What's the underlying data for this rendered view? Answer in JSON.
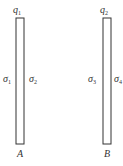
{
  "diagram": {
    "type": "parallel-plates",
    "plates": [
      {
        "name": "A",
        "charge_label": "q",
        "charge_sub": "1",
        "left_density": "σ",
        "left_density_sub": "1",
        "right_density": "σ",
        "right_density_sub": "2"
      },
      {
        "name": "B",
        "charge_label": "q",
        "charge_sub": "2",
        "left_density": "σ",
        "left_density_sub": "3",
        "right_density": "σ",
        "right_density_sub": "4"
      }
    ],
    "colors": {
      "stroke": "#333333",
      "background": "#ffffff"
    }
  }
}
